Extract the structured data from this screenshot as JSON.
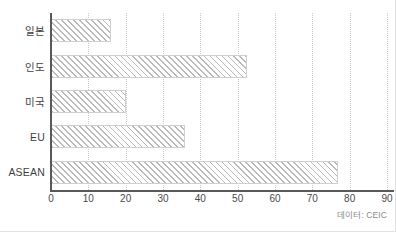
{
  "chart_data": {
    "type": "bar",
    "orientation": "horizontal",
    "title": "",
    "subtitle": "",
    "xlabel": "",
    "ylabel": "",
    "categories": [
      "일본",
      "인도",
      "미국",
      "EU",
      "ASEAN"
    ],
    "values": [
      16,
      52.5,
      20,
      36,
      77
    ],
    "xlim": [
      0,
      90
    ],
    "xticks": [
      0,
      10,
      20,
      30,
      40,
      50,
      60,
      70,
      80,
      90
    ],
    "xtick_labels": [
      "0",
      "10",
      "20",
      "30",
      "40",
      "50",
      "60",
      "70",
      "80",
      "90"
    ],
    "grid": true,
    "grid_axis": "x",
    "grid_style": "dotted",
    "legend": false,
    "legend_position": "none",
    "bar_fill": "diagonal-hatch",
    "bar_color": "#b9b9b9",
    "axis_color": "#58595b",
    "grid_color": "#c9c9c9",
    "background": "#ffffff",
    "source_note": "데이터: CEIC"
  },
  "source": {
    "label": "데이터: CEIC"
  }
}
